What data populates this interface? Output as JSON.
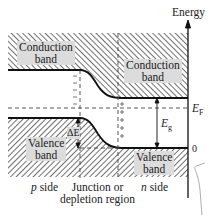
{
  "diagram": {
    "axis_label": "Energy",
    "fermi_label": "E",
    "fermi_sub": "F",
    "gap_label": "E",
    "gap_sub": "g",
    "zero_label": "0",
    "delta_e_label": "ΔE",
    "regions": {
      "p_side_prefix": "p",
      "p_side_suffix": " side",
      "junction_line1": "Junction or",
      "junction_line2": "depletion region",
      "n_side_prefix": "n",
      "n_side_suffix": " side"
    },
    "bands": {
      "conduction_left_l1": "Conduction",
      "conduction_left_l2": "band",
      "conduction_right_l1": "Conduction",
      "conduction_right_l2": "band",
      "valence_left_l1": "Valence",
      "valence_left_l2": "band",
      "valence_right_l1": "Valence",
      "valence_right_l2": "band"
    },
    "colors": {
      "hatch": "#333333",
      "label_bg": "#dcdcdc",
      "line": "#111111"
    }
  }
}
